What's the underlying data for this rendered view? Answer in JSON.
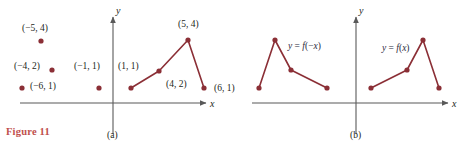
{
  "figure": {
    "caption": "Figure 11",
    "caption_color": "#c0504d",
    "curve_color": "#8b2f36",
    "axis_color": "#595959",
    "text_color": "#231f20"
  },
  "panels": [
    {
      "key": "a",
      "label": "(a)",
      "axis_x_label": "x",
      "axis_y_label": "y",
      "point_labels": [
        {
          "text": "(−5, 4)",
          "x": 22,
          "y": 24
        },
        {
          "text": "(−4, 2)",
          "x": 14,
          "y": 62
        },
        {
          "text": "(−6, 1)",
          "x": 30,
          "y": 82
        },
        {
          "text": "(−1, 1)",
          "x": 74,
          "y": 62
        },
        {
          "text": "(1, 1)",
          "x": 118,
          "y": 62
        },
        {
          "text": "(5, 4)",
          "x": 178,
          "y": 20
        },
        {
          "text": "(4, 2)",
          "x": 166,
          "y": 80
        },
        {
          "text": "(6, 1)",
          "x": 214,
          "y": 84
        }
      ]
    },
    {
      "key": "b",
      "label": "(b)",
      "axis_x_label": "x",
      "axis_y_label": "y",
      "curve_labels": [
        {
          "text": "y = f(−x)",
          "x": 288,
          "y": 42
        },
        {
          "text": "y = f(x)",
          "x": 382,
          "y": 44
        }
      ]
    }
  ],
  "chart_data": {
    "type": "scatter",
    "title": "Figure 11",
    "xlabel": "x",
    "ylabel": "y",
    "grid": false,
    "legend": "none",
    "panels": [
      {
        "name": "(a)",
        "description": "Scattered isolated points on the left of the y-axis and a connected polyline on the right of the y-axis.",
        "isolated_points": [
          {
            "label": "(−5, 4)",
            "x": -5,
            "y": 4
          },
          {
            "label": "(−4, 2)",
            "x": -4,
            "y": 2
          },
          {
            "label": "(−6, 1)",
            "x": -6,
            "y": 1
          },
          {
            "label": "(−1, 1)",
            "x": -1,
            "y": 1
          }
        ],
        "series": [
          {
            "name": "y = f(x)",
            "type": "line",
            "points": [
              {
                "label": "(1, 1)",
                "x": 1,
                "y": 1
              },
              {
                "label": "(4, 2)",
                "x": 4,
                "y": 2
              },
              {
                "label": "(5, 4)",
                "x": 5,
                "y": 4
              },
              {
                "label": "(6, 1)",
                "x": 6,
                "y": 1
              }
            ]
          }
        ]
      },
      {
        "name": "(b)",
        "description": "Left branch is the reflection y = f(−x); right branch is y = f(x).",
        "series": [
          {
            "name": "y = f(−x)",
            "type": "line",
            "points": [
              {
                "x": -6,
                "y": 1
              },
              {
                "x": -5,
                "y": 4
              },
              {
                "x": -4,
                "y": 2
              },
              {
                "x": -1,
                "y": 1
              }
            ]
          },
          {
            "name": "y = f(x)",
            "type": "line",
            "points": [
              {
                "x": 1,
                "y": 1
              },
              {
                "x": 4,
                "y": 2
              },
              {
                "x": 5,
                "y": 4
              },
              {
                "x": 6,
                "y": 1
              }
            ]
          }
        ]
      }
    ]
  }
}
